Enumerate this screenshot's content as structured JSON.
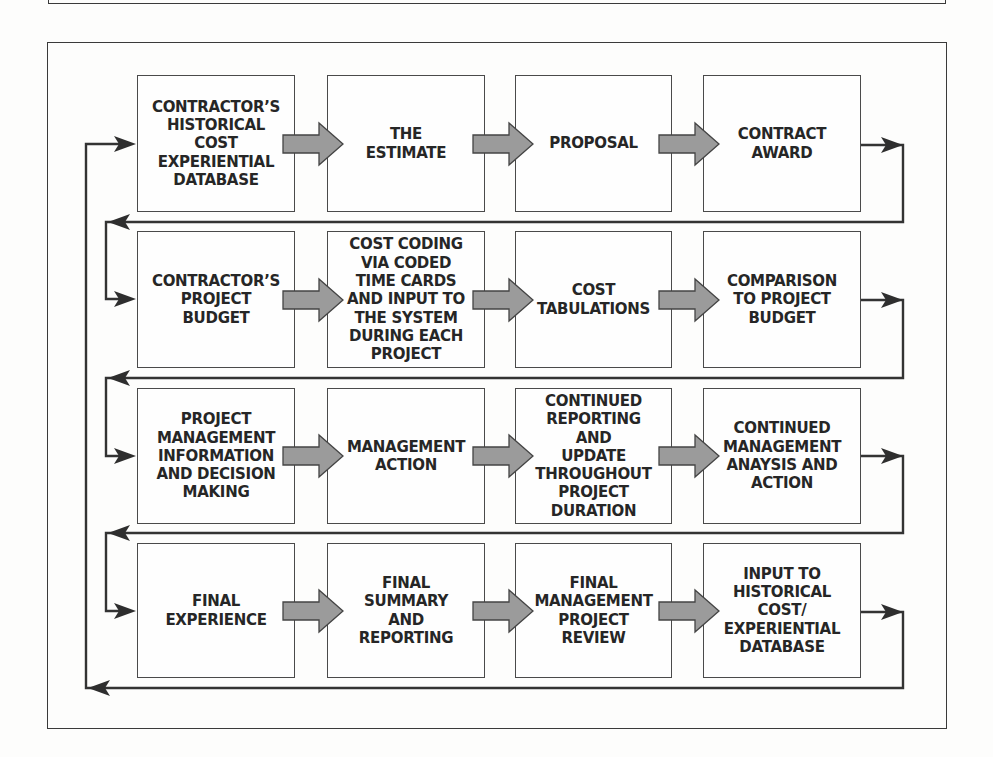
{
  "figure": {
    "rows": [
      {
        "boxes": [
          {
            "label": "CONTRACTOR’S\nHISTORICAL\nCOST\nEXPERIENTIAL\nDATABASE"
          },
          {
            "label": "THE\nESTIMATE"
          },
          {
            "label": "PROPOSAL"
          },
          {
            "label": "CONTRACT\nAWARD"
          }
        ]
      },
      {
        "boxes": [
          {
            "label": "CONTRACTOR’S\nPROJECT\nBUDGET"
          },
          {
            "label": "COST CODING\nVIA CODED\nTIME CARDS\nAND INPUT TO\nTHE SYSTEM\nDURING EACH\nPROJECT"
          },
          {
            "label": "COST\nTABULATIONS"
          },
          {
            "label": "COMPARISON\nTO PROJECT\nBUDGET"
          }
        ]
      },
      {
        "boxes": [
          {
            "label": "PROJECT\nMANAGEMENT\nINFORMATION\nAND DECISION\nMAKING"
          },
          {
            "label": "MANAGEMENT\nACTION"
          },
          {
            "label": "CONTINUED\nREPORTING\nAND\nUPDATE\nTHROUGHOUT\nPROJECT\nDURATION"
          },
          {
            "label": "CONTINUED\nMANAGEMENT\nANAYSIS AND\nACTION"
          }
        ]
      },
      {
        "boxes": [
          {
            "label": "FINAL\nEXPERIENCE"
          },
          {
            "label": "FINAL\nSUMMARY\nAND\nREPORTING"
          },
          {
            "label": "FINAL\nMANAGEMENT\nPROJECT\nREVIEW"
          },
          {
            "label": "INPUT TO\nHISTORICAL\nCOST/\nEXPERIENTIAL\nDATABASE"
          }
        ]
      }
    ]
  },
  "colors": {
    "block_arrow_fill": "#9b9b9b",
    "block_arrow_outline": "#444444",
    "connector_line": "#333333",
    "box_border": "#4a4a4a",
    "text": "#262626",
    "background": "#fdfdfc"
  }
}
